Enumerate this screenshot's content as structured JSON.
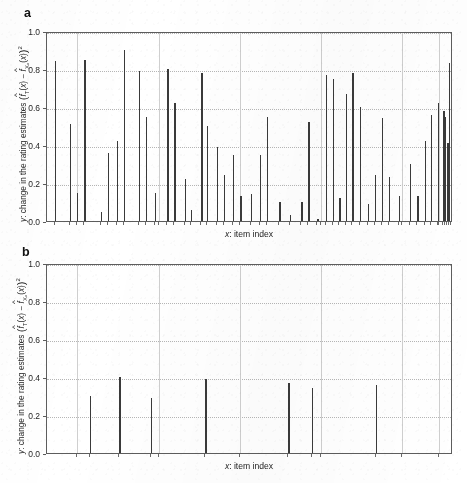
{
  "figure": {
    "panels": [
      {
        "letter": "a",
        "xlabel_var": "x",
        "xlabel_text": ": item index",
        "ylabel_prefix": "y",
        "ylabel_text": ": change in the rating estimates",
        "yticks": [
          "0.0",
          "0.2",
          "0.4",
          "0.6",
          "0.8",
          "1.0"
        ]
      },
      {
        "letter": "b",
        "xlabel_var": "x",
        "xlabel_text": ": item index",
        "ylabel_prefix": "y",
        "ylabel_text": ": change in the rating estimates",
        "yticks": [
          "0.0",
          "0.2",
          "0.4",
          "0.6",
          "0.8",
          "1.0"
        ]
      }
    ]
  },
  "chart_data": [
    {
      "type": "bar",
      "panel": "a",
      "title": "",
      "xlabel": "x: item index",
      "ylabel": "y: change in the rating estimates (f_T(x) - f_Xs(x))^2",
      "ylim": [
        0.0,
        1.0
      ],
      "xlim": [
        0,
        100
      ],
      "yticks": [
        0.0,
        0.2,
        0.4,
        0.6,
        0.8,
        1.0
      ],
      "xticks_labeled": false,
      "grid": "both-faint",
      "bar_color": "#3a3a3a",
      "x": [
        2.0,
        5.6,
        7.4,
        9.2,
        13.2,
        15.0,
        17.2,
        19.0,
        22.6,
        24.4,
        26.6,
        29.6,
        31.4,
        34.0,
        35.4,
        38.0,
        39.4,
        41.8,
        43.6,
        45.8,
        47.6,
        50.2,
        52.4,
        54.2,
        57.2,
        59.8,
        62.6,
        64.4,
        66.6,
        68.6,
        70.4,
        72.0,
        73.6,
        75.2,
        77.0,
        79.0,
        80.8,
        82.4,
        84.2,
        86.6,
        89.4,
        91.2,
        93.0,
        94.6,
        96.2,
        97.6,
        98.6
      ],
      "values": [
        0.84,
        0.51,
        0.15,
        0.85,
        0.05,
        0.36,
        0.42,
        0.9,
        0.79,
        0.55,
        0.15,
        0.8,
        0.62,
        0.22,
        0.06,
        0.78,
        0.5,
        0.39,
        0.24,
        0.35,
        0.13,
        0.14,
        0.35,
        0.55,
        0.1,
        0.03,
        0.1,
        0.52,
        0.01,
        0.77,
        0.75,
        0.12,
        0.67,
        0.78,
        0.6,
        0.09,
        0.24,
        0.54,
        0.23,
        0.13,
        0.3,
        0.13,
        0.42,
        0.56,
        0.62,
        0.58,
        0.41
      ]
    },
    {
      "type": "bar",
      "panel": "b",
      "title": "",
      "xlabel": "x: item index",
      "ylabel": "y: change in the rating estimates (f_T(x) - f_Xs(x))^2",
      "ylim": [
        0.0,
        1.0
      ],
      "xlim": [
        0,
        100
      ],
      "yticks": [
        0.0,
        0.2,
        0.4,
        0.6,
        0.8,
        1.0
      ],
      "xticks_labeled": false,
      "grid": "both-faint",
      "bar_color": "#3a3a3a",
      "x": [
        10.5,
        17.8,
        25.6,
        39.0,
        59.4,
        65.2,
        81.0
      ],
      "values": [
        0.3,
        0.4,
        0.29,
        0.39,
        0.37,
        0.34,
        0.36
      ]
    }
  ],
  "chart_data_extra_a": {
    "tail_x": [
      98.0,
      99.0,
      99.6
    ],
    "tail_values": [
      0.55,
      0.83,
      0.2
    ]
  }
}
